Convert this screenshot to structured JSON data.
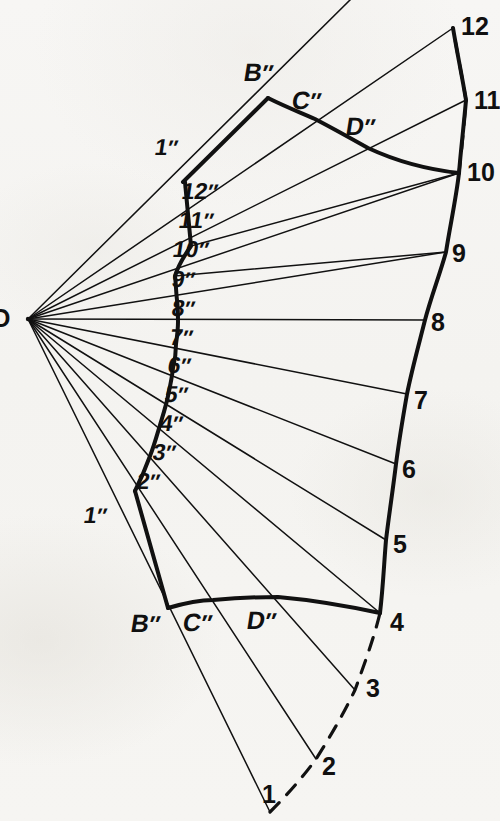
{
  "figure": {
    "apex_label": "O",
    "stroke_color": "#111111",
    "background_color": "#f6f5f3",
    "thin_line_width": 1.4,
    "thick_line_width": 4.0,
    "apex": {
      "x": 28,
      "y": 319
    }
  },
  "outer_points": [
    {
      "id": "1",
      "label": "1",
      "x": 270,
      "y": 812,
      "label_x": 262,
      "label_y": 782,
      "dashed_to_next": true
    },
    {
      "id": "2",
      "label": "2",
      "x": 316,
      "y": 759,
      "label_x": 322,
      "label_y": 754,
      "dashed_to_next": true
    },
    {
      "id": "3",
      "label": "3",
      "x": 355,
      "y": 690,
      "label_x": 366,
      "label_y": 676,
      "dashed_to_next": true
    },
    {
      "id": "4",
      "label": "4",
      "x": 380,
      "y": 613,
      "label_x": 390,
      "label_y": 610,
      "dashed_to_next": false
    },
    {
      "id": "5",
      "label": "5",
      "x": 386,
      "y": 540,
      "label_x": 393,
      "label_y": 532,
      "dashed_to_next": false
    },
    {
      "id": "6",
      "label": "6",
      "x": 396,
      "y": 464,
      "label_x": 402,
      "label_y": 457,
      "dashed_to_next": false
    },
    {
      "id": "7",
      "label": "7",
      "x": 407,
      "y": 394,
      "label_x": 414,
      "label_y": 388,
      "dashed_to_next": false
    },
    {
      "id": "8",
      "label": "8",
      "x": 425,
      "y": 320,
      "label_x": 431,
      "label_y": 313,
      "dashed_to_next": false
    },
    {
      "id": "9",
      "label": "9",
      "x": 446,
      "y": 252,
      "label_x": 452,
      "label_y": 244,
      "dashed_to_next": false
    },
    {
      "id": "10",
      "label": "10",
      "x": 459,
      "y": 173,
      "label_x": 467,
      "label_y": 164,
      "dashed_to_next": true
    },
    {
      "id": "11",
      "label": "11",
      "x": 466,
      "y": 100,
      "label_x": 474,
      "label_y": 92,
      "dashed_to_next": true
    },
    {
      "id": "12",
      "label": "12",
      "x": 453,
      "y": 28,
      "label_x": 461,
      "label_y": 18,
      "dashed_to_next": false
    }
  ],
  "inner_points": [
    {
      "id": "1s",
      "label": "1",
      "x": 135,
      "y": 491,
      "label_x": 88,
      "label_y": 508
    },
    {
      "id": "2s",
      "label": "2",
      "x": 150,
      "y": 456,
      "label_x": 141,
      "label_y": 474
    },
    {
      "id": "3s",
      "label": "3",
      "x": 160,
      "y": 425,
      "label_x": 156,
      "label_y": 446
    },
    {
      "id": "4s",
      "label": "4",
      "x": 168,
      "y": 396,
      "label_x": 163,
      "label_y": 417
    },
    {
      "id": "5s",
      "label": "5",
      "x": 173,
      "y": 368,
      "label_x": 168,
      "label_y": 388
    },
    {
      "id": "6s",
      "label": "6",
      "x": 176,
      "y": 344,
      "label_x": 170,
      "label_y": 358
    },
    {
      "id": "7s",
      "label": "7",
      "x": 178,
      "y": 322,
      "label_x": 171,
      "label_y": 330
    },
    {
      "id": "8s",
      "label": "8",
      "x": 177,
      "y": 300,
      "label_x": 173,
      "label_y": 302
    },
    {
      "id": "9s",
      "label": "9",
      "x": 175,
      "y": 276,
      "label_x": 172,
      "label_y": 275
    },
    {
      "id": "10s",
      "label": "10",
      "x": 191,
      "y": 246,
      "label_x": 174,
      "label_y": 247
    },
    {
      "id": "11s",
      "label": "11",
      "x": 188,
      "y": 214,
      "label_x": 180,
      "label_y": 218
    },
    {
      "id": "12s",
      "label": "12",
      "x": 185,
      "y": 182,
      "label_x": 183,
      "label_y": 187
    }
  ],
  "corner_points": {
    "top_B": {
      "label": "B",
      "x": 268,
      "y": 98,
      "label_x": 247,
      "label_y": 66
    },
    "top_C": {
      "label": "C",
      "x": 315,
      "y": 119,
      "label_x": 295,
      "label_y": 94
    },
    "top_D": {
      "label": "D",
      "x": 368,
      "y": 148,
      "label_x": 349,
      "label_y": 120
    },
    "top_1s": {
      "label": "1",
      "x": 183,
      "y": 182,
      "label_x": 158,
      "label_y": 142
    },
    "bot_1s": {
      "label": "1",
      "x": 135,
      "y": 491,
      "label_x": 88,
      "label_y": 508
    },
    "bot_B": {
      "label": "B",
      "x": 168,
      "y": 608,
      "label_x": 135,
      "label_y": 614
    },
    "bot_C": {
      "label": "C",
      "x": 213,
      "y": 600,
      "label_x": 186,
      "label_y": 613
    },
    "bot_D": {
      "label": "D",
      "x": 278,
      "y": 597,
      "label_x": 250,
      "label_y": 611
    }
  },
  "prime_mark": "″",
  "annotations": {
    "apex_note": "O",
    "inner_curve_name": "inner-development-curve",
    "outer_curve_name": "outer-development-curve"
  }
}
